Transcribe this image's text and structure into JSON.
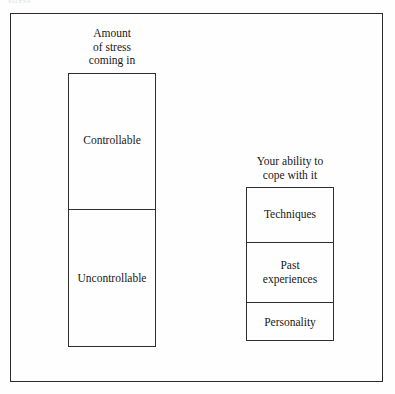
{
  "figure": {
    "scan_artifact_text": "stress",
    "background_color": "#fefefe",
    "line_color": "#2b2b2b",
    "text_color": "#181818"
  },
  "stress_column": {
    "caption": "Amount\nof stress\ncoming in",
    "segments": [
      {
        "label": "Controllable"
      },
      {
        "label": "Uncontrollable"
      }
    ]
  },
  "coping_column": {
    "caption": "Your ability to\ncope with it",
    "segments": [
      {
        "label": "Techniques"
      },
      {
        "label": "Past\nexperiences"
      },
      {
        "label": "Personality"
      }
    ]
  }
}
